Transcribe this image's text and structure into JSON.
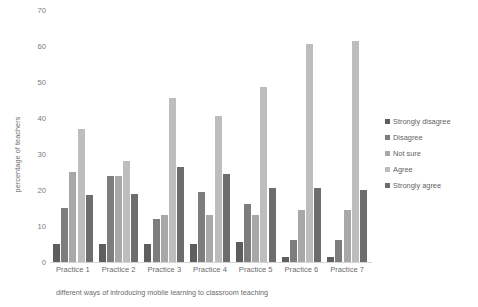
{
  "chart_data": {
    "type": "bar",
    "title": "",
    "xlabel": "different ways of introducing mobile learning to classroom teaching",
    "ylabel": "percentage of teachers",
    "categories": [
      "Practice 1",
      "Practice 2",
      "Practice 3",
      "Practice 4",
      "Practice 5",
      "Practice 6",
      "Practice 7"
    ],
    "ylim": [
      0,
      70
    ],
    "yticks": [
      0,
      10,
      20,
      30,
      40,
      50,
      60,
      70
    ],
    "grid": false,
    "legend_position": "right",
    "series": [
      {
        "name": "Strongly disagree",
        "color": "#5e5e5e",
        "values": [
          5,
          5,
          5,
          5,
          5.5,
          1.5,
          1.5
        ]
      },
      {
        "name": "Disagree",
        "color": "#7d7d7d",
        "values": [
          15,
          24,
          12,
          19.5,
          16,
          6,
          6
        ]
      },
      {
        "name": "Not sure",
        "color": "#a8a8a8",
        "values": [
          25,
          24,
          13,
          13,
          13,
          14.5,
          14.5
        ]
      },
      {
        "name": "Agree",
        "color": "#bdbdbd",
        "values": [
          37,
          28,
          45.5,
          40.5,
          48.5,
          60.5,
          61.5
        ]
      },
      {
        "name": "Strongly agree",
        "color": "#6d6d6d",
        "values": [
          18.5,
          19,
          26.5,
          24.5,
          20.5,
          20.5,
          20
        ]
      }
    ]
  }
}
